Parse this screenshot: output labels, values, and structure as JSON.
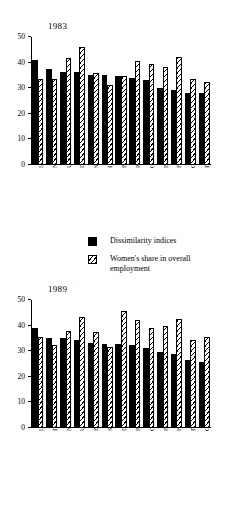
{
  "chart_data": [
    {
      "type": "bar",
      "title": "1983",
      "xlabel": "",
      "ylabel": "",
      "ylim": [
        0,
        50
      ],
      "yticks": [
        0,
        10,
        20,
        30,
        40,
        50
      ],
      "grid": false,
      "legend_position": "below-figure",
      "categories": [
        "LUXEMBOURG",
        "NETHERLANDS",
        "UNITED KINGDOM",
        "DENMARK",
        "SPAIN",
        "IRELAND",
        "BELGIUM",
        "PORTUGAL",
        "GERMANY",
        "EUROPE 10",
        "FRANCE",
        "GREECE",
        "ITALY"
      ],
      "series": [
        {
          "name": "Dissimilarity indices",
          "values": [
            41.2,
            37.5,
            36.5,
            36.2,
            35.2,
            35.0,
            34.8,
            34.0,
            33.2,
            30.0,
            29.4,
            28.2,
            28.2
          ]
        },
        {
          "name": "Women's share in overall employment",
          "values": [
            33.5,
            33.7,
            41.8,
            46.0,
            36.0,
            31.3,
            34.9,
            40.7,
            39.5,
            38.4,
            42.0,
            33.5,
            32.6
          ]
        }
      ]
    },
    {
      "type": "bar",
      "title": "1989",
      "xlabel": "",
      "ylabel": "",
      "ylim": [
        0,
        50
      ],
      "yticks": [
        0,
        10,
        20,
        30,
        40,
        50
      ],
      "grid": false,
      "legend_position": "below-figure",
      "categories": [
        "LUXEMBOURG",
        "IRELAND",
        "NETHERLANDS",
        "UNITED KINGDOM",
        "BELGIUM",
        "SPAIN",
        "DENMARK",
        "PORTUGAL",
        "GERMANY",
        "EUROPE 10",
        "FRANCE",
        "ITALY",
        "GREECE"
      ],
      "series": [
        {
          "name": "Dissimilarity indices",
          "values": [
            39.2,
            35.3,
            35.2,
            34.5,
            33.2,
            32.7,
            33.0,
            32.5,
            31.2,
            29.5,
            29.1,
            26.4,
            25.8
          ]
        },
        {
          "name": "Women's share in overall employment",
          "values": [
            35.4,
            32.6,
            37.8,
            43.4,
            37.5,
            31.6,
            45.9,
            42.3,
            39.1,
            40.0,
            42.7,
            34.5,
            35.5
          ]
        }
      ]
    }
  ],
  "legend": {
    "items": [
      {
        "label": "Dissimilarity indices",
        "pattern": "solid-black"
      },
      {
        "label": "Women's share in overall employment",
        "pattern": "diagonal-hatch"
      }
    ]
  }
}
